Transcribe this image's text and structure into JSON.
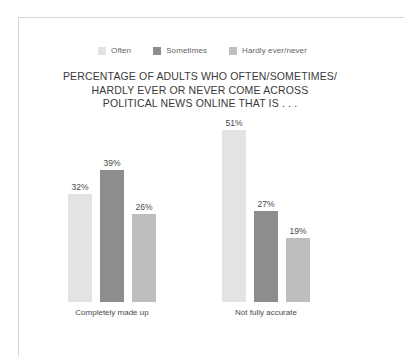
{
  "chart_data": {
    "type": "bar",
    "title": "PERCENTAGE OF ADULTS WHO OFTEN/SOMETIMES/ HARDLY EVER OR NEVER COME ACROSS POLITICAL NEWS ONLINE THAT IS . . .",
    "title_lines": [
      "PERCENTAGE OF ADULTS WHO OFTEN/SOMETIMES/",
      "HARDLY EVER OR NEVER COME ACROSS",
      "POLITICAL NEWS ONLINE THAT IS . . ."
    ],
    "categories": [
      "Completely made up",
      "Not fully accurate"
    ],
    "series": [
      {
        "name": "Often",
        "color": "#e3e3e3",
        "values": [
          32,
          39
        ],
        "labels": [
          "32%",
          "39%"
        ]
      },
      {
        "name": "Sometimes",
        "color": "#8d8d8d",
        "values": [
          39,
          27
        ],
        "labels": [
          "39%",
          "27%"
        ]
      },
      {
        "name": "Hardly ever/never",
        "color": "#bebebe",
        "values": [
          26,
          19
        ],
        "labels": [
          "26%",
          "19%"
        ]
      }
    ],
    "grouped_values": [
      {
        "category": "Completely made up",
        "bars": [
          {
            "series": "Often",
            "value": 32,
            "label": "32%",
            "color": "#e3e3e3"
          },
          {
            "series": "Sometimes",
            "value": 39,
            "label": "39%",
            "color": "#8d8d8d"
          },
          {
            "series": "Hardly ever/never",
            "value": 26,
            "label": "26%",
            "color": "#bebebe"
          }
        ]
      },
      {
        "category": "Not fully accurate",
        "bars": [
          {
            "series": "Often",
            "value": 51,
            "label": "51%",
            "color": "#e3e3e3"
          },
          {
            "series": "Sometimes",
            "value": 27,
            "label": "27%",
            "color": "#8d8d8d"
          },
          {
            "series": "Hardly ever/never",
            "value": 19,
            "label": "19%",
            "color": "#bebebe"
          }
        ]
      }
    ],
    "xlabel": "",
    "ylabel": "",
    "ylim": [
      0,
      55
    ],
    "grid": false,
    "legend_position": "top-center",
    "value_labels_shown": true,
    "units": "percent"
  },
  "legend": {
    "items": [
      {
        "label": "Often",
        "color": "#e3e3e3"
      },
      {
        "label": "Sometimes",
        "color": "#8d8d8d"
      },
      {
        "label": "Hardly ever/never",
        "color": "#bebebe"
      }
    ]
  },
  "title": {
    "line1": "PERCENTAGE OF ADULTS WHO OFTEN/SOMETIMES/",
    "line2": "HARDLY EVER OR NEVER COME ACROSS",
    "line3": "POLITICAL NEWS ONLINE THAT IS . . ."
  },
  "axis": {
    "categories": [
      {
        "label": "Completely made up"
      },
      {
        "label": "Not fully accurate"
      }
    ],
    "line_color": "#4a4a4a"
  }
}
